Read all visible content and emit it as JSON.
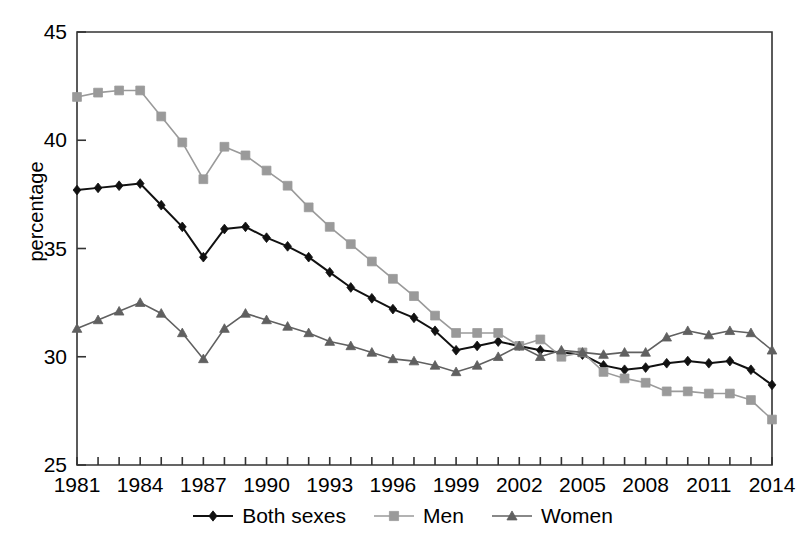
{
  "chart_data": {
    "type": "line",
    "title": "",
    "xlabel": "",
    "ylabel": "percentage",
    "xlim": [
      1981,
      2014
    ],
    "ylim": [
      25,
      45
    ],
    "yticks": [
      25,
      30,
      35,
      40,
      45
    ],
    "xticks_labeled": [
      1981,
      1984,
      1987,
      1990,
      1993,
      1996,
      1999,
      2002,
      2005,
      2008,
      2011,
      2014
    ],
    "grid": false,
    "legend_position": "bottom",
    "x": [
      1981,
      1982,
      1983,
      1984,
      1985,
      1986,
      1987,
      1988,
      1989,
      1990,
      1991,
      1992,
      1993,
      1994,
      1995,
      1996,
      1997,
      1998,
      1999,
      2000,
      2001,
      2002,
      2003,
      2004,
      2005,
      2006,
      2007,
      2008,
      2009,
      2010,
      2011,
      2012,
      2013,
      2014
    ],
    "series": [
      {
        "name": "Both sexes",
        "color": "#111111",
        "marker": "diamond",
        "values": [
          37.7,
          37.8,
          37.9,
          38.0,
          37.0,
          36.0,
          34.6,
          35.9,
          36.0,
          35.5,
          35.1,
          34.6,
          33.9,
          33.2,
          32.7,
          32.2,
          31.8,
          31.2,
          30.3,
          30.5,
          30.7,
          30.5,
          30.3,
          30.2,
          30.1,
          29.6,
          29.4,
          29.5,
          29.7,
          29.8,
          29.7,
          29.8,
          29.4,
          28.7
        ]
      },
      {
        "name": "Men",
        "color": "#9a9a9a",
        "marker": "square",
        "values": [
          42.0,
          42.2,
          42.3,
          42.3,
          41.1,
          39.9,
          38.2,
          39.7,
          39.3,
          38.6,
          37.9,
          36.9,
          36.0,
          35.2,
          34.4,
          33.6,
          32.8,
          31.9,
          31.1,
          31.1,
          31.1,
          30.5,
          30.8,
          30.0,
          30.2,
          29.3,
          29.0,
          28.8,
          28.4,
          28.4,
          28.3,
          28.3,
          28.0,
          27.1
        ]
      },
      {
        "name": "Women",
        "color": "#606060",
        "marker": "triangle",
        "values": [
          31.3,
          31.7,
          32.1,
          32.5,
          32.0,
          31.1,
          29.9,
          31.3,
          32.0,
          31.7,
          31.4,
          31.1,
          30.7,
          30.5,
          30.2,
          29.9,
          29.8,
          29.6,
          29.3,
          29.6,
          30.0,
          30.5,
          30.0,
          30.3,
          30.2,
          30.1,
          30.2,
          30.2,
          30.9,
          31.2,
          31.0,
          31.2,
          31.1,
          30.3
        ]
      }
    ]
  },
  "axes": {
    "ylabel": "percentage",
    "ytick_labels": [
      "45",
      "40",
      "35",
      "30",
      "25"
    ],
    "xtick_labels": [
      "1981",
      "1984",
      "1987",
      "1990",
      "1993",
      "1996",
      "1999",
      "2002",
      "2005",
      "2008",
      "2011",
      "2014"
    ]
  },
  "legend": {
    "items": [
      {
        "label": "Both sexes",
        "color": "#111111",
        "marker": "diamond"
      },
      {
        "label": "Men",
        "color": "#9a9a9a",
        "marker": "square"
      },
      {
        "label": "Women",
        "color": "#606060",
        "marker": "triangle"
      }
    ]
  }
}
